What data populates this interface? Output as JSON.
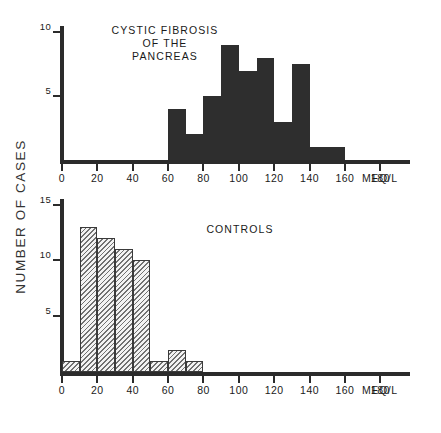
{
  "figure": {
    "y_axis_title": "NUMBER OF CASES",
    "unit_label": "MEQ/L"
  },
  "panels": [
    {
      "id": "cystic-fibrosis",
      "title": "CYSTIC FIBROSIS\nOF THE\nPANCREAS",
      "y_ticks": [
        "5",
        "10"
      ],
      "x_ticks": [
        "0",
        "20",
        "40",
        "60",
        "80",
        "100",
        "120",
        "140",
        "160",
        "180"
      ],
      "bar_style": "solid"
    },
    {
      "id": "controls",
      "title": "CONTROLS",
      "y_ticks": [
        "5",
        "10",
        "15"
      ],
      "x_ticks": [
        "0",
        "20",
        "40",
        "60",
        "80",
        "100",
        "120",
        "140",
        "160",
        "180"
      ],
      "bar_style": "hatched"
    }
  ],
  "chart_data": [
    {
      "type": "bar",
      "id": "cystic-fibrosis-histogram",
      "title": "CYSTIC FIBROSIS OF THE PANCREAS",
      "xlabel": "MEQ/L",
      "ylabel": "NUMBER OF CASES",
      "xlim": [
        0,
        190
      ],
      "ylim": [
        0,
        10.5
      ],
      "grid": false,
      "legend": "none",
      "bin_width": 10,
      "bin_edges": [
        60,
        70,
        80,
        90,
        100,
        110,
        120,
        130,
        140,
        150,
        160
      ],
      "categories": [
        "60-70",
        "70-80",
        "80-90",
        "90-100",
        "100-110",
        "110-120",
        "120-130",
        "130-140",
        "140-150",
        "150-160"
      ],
      "values": [
        4,
        2,
        5,
        9,
        7,
        8,
        3,
        7.5,
        1,
        1
      ],
      "x_tick_values": [
        0,
        20,
        40,
        60,
        80,
        100,
        120,
        140,
        160,
        180
      ],
      "y_tick_values": [
        0,
        5,
        10
      ]
    },
    {
      "type": "bar",
      "id": "controls-histogram",
      "title": "CONTROLS",
      "xlabel": "MEQ/L",
      "ylabel": "NUMBER OF CASES",
      "xlim": [
        0,
        190
      ],
      "ylim": [
        0,
        15.5
      ],
      "grid": false,
      "legend": "none",
      "bin_width": 10,
      "bin_edges": [
        0,
        10,
        20,
        30,
        40,
        50,
        60,
        70,
        80
      ],
      "categories": [
        "0-10",
        "10-20",
        "20-30",
        "30-40",
        "40-50",
        "50-60",
        "60-70",
        "70-80"
      ],
      "values": [
        1,
        13,
        12,
        11,
        10,
        1,
        2,
        1
      ],
      "x_tick_values": [
        0,
        20,
        40,
        60,
        80,
        100,
        120,
        140,
        160,
        180
      ],
      "y_tick_values": [
        0,
        5,
        10,
        15
      ]
    }
  ]
}
